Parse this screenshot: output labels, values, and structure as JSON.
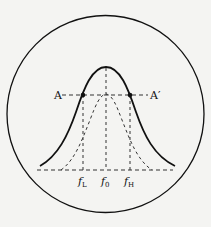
{
  "diagram": {
    "type": "resonance-curve-bandwidth",
    "colors": {
      "background": "#f4f4f2",
      "stroke": "#111111",
      "dashed": "#333333"
    },
    "labels": {
      "point_left": "A",
      "point_right": "A′",
      "freq_low": "f",
      "freq_low_sub": "L",
      "freq_center": "f",
      "freq_center_sub": "0",
      "freq_high": "f",
      "freq_high_sub": "H"
    }
  }
}
